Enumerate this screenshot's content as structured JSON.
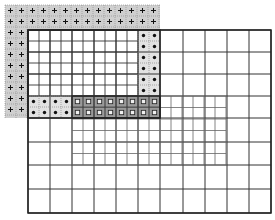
{
  "diagram": {
    "width": 275,
    "height": 220,
    "cell": 11,
    "colors": {
      "gray_region": "#cfcfcf",
      "dark_region": "#9a9a9a",
      "light_dot_region": "#e2e2e2",
      "line": "#333333",
      "thin_line": "#666666",
      "dotted_line": "#888888",
      "marker": "#111111"
    },
    "gray_plus_region": {
      "x": 5,
      "y": 5,
      "w": 155,
      "h": 113,
      "marker": "plus"
    },
    "outer_box": {
      "x": 28,
      "y": 30,
      "w": 243,
      "h": 183
    },
    "fine_white_box": {
      "x": 28,
      "y": 30,
      "w": 110,
      "h": 66,
      "cols": 10,
      "rows": 6
    },
    "dot_strip_right": {
      "x": 138,
      "y": 30,
      "w": 22,
      "h": 66,
      "cols": 2,
      "rows": 6,
      "marker": "dot"
    },
    "dot_strip_bottom": {
      "x": 28,
      "y": 96,
      "w": 44,
      "h": 22,
      "cols": 4,
      "rows": 2,
      "marker": "dot"
    },
    "square_strip": {
      "x": 72,
      "y": 96,
      "w": 88,
      "h": 22,
      "cols": 8,
      "rows": 2,
      "marker": "square"
    },
    "fine_grid_lower": {
      "x": 72,
      "y": 96,
      "w": 154,
      "h": 69,
      "cols": 14,
      "rows": 6
    },
    "coarse_grid": {
      "x": 28,
      "y": 30,
      "w": 243,
      "h": 183,
      "xs": [
        28,
        50,
        72,
        94,
        116,
        138,
        160,
        183,
        205,
        227,
        249,
        271
      ],
      "ys": [
        30,
        52,
        74,
        96,
        118,
        142,
        165,
        189,
        213
      ]
    }
  }
}
